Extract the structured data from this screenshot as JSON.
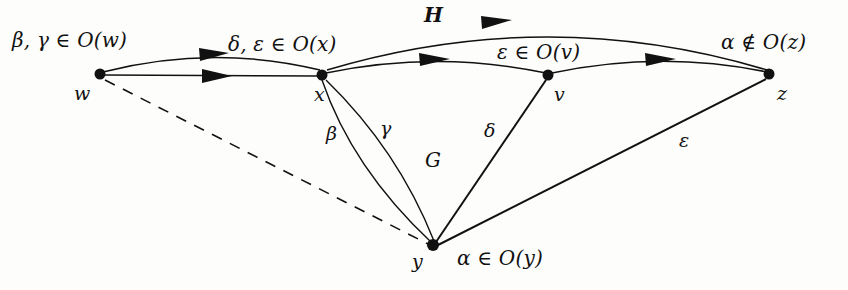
{
  "figure": {
    "title_text": "",
    "background_color": "#fdfdfb",
    "stroke_color": "#111111"
  },
  "nodes": [
    {
      "id": "w",
      "label": "w",
      "x": 100,
      "y": 74,
      "label_x": 74,
      "label_y": 84
    },
    {
      "id": "x",
      "label": "x",
      "x": 322,
      "y": 75,
      "label_x": 314,
      "label_y": 85
    },
    {
      "id": "v",
      "label": "v",
      "x": 548,
      "y": 75,
      "label_x": 554,
      "label_y": 85
    },
    {
      "id": "z",
      "label": "z",
      "x": 769,
      "y": 74,
      "label_x": 777,
      "label_y": 84
    },
    {
      "id": "y",
      "label": "y",
      "x": 433,
      "y": 245,
      "label_x": 412,
      "label_y": 252
    }
  ],
  "set_labels": [
    {
      "id": "o-w",
      "text": "β, γ ∈ O(w)",
      "x": 12,
      "y": 30
    },
    {
      "id": "o-x",
      "text": "δ, ε ∈ O(x)",
      "x": 228,
      "y": 34
    },
    {
      "id": "o-v",
      "text": "ε ∈ O(v)",
      "x": 497,
      "y": 42
    },
    {
      "id": "o-z",
      "text": "α ∉ O(z)",
      "x": 721,
      "y": 32
    },
    {
      "id": "o-y",
      "text": "α ∈ O(y)",
      "x": 457,
      "y": 248
    }
  ],
  "edge_labels": [
    {
      "id": "beta",
      "text": "β",
      "x": 326,
      "y": 124
    },
    {
      "id": "gamma",
      "text": "γ",
      "x": 380,
      "y": 119
    },
    {
      "id": "delta",
      "text": "δ",
      "x": 484,
      "y": 121
    },
    {
      "id": "epsilon",
      "text": "ε",
      "x": 679,
      "y": 131
    }
  ],
  "graph_labels": [
    {
      "id": "G",
      "text": "G",
      "x": 425,
      "y": 150
    },
    {
      "id": "H",
      "text": "H",
      "x": 424,
      "y": 5
    }
  ],
  "edges": [
    {
      "id": "w-x-arc",
      "from": "w",
      "to": "x",
      "style": "curved",
      "directed": true,
      "graph": "H"
    },
    {
      "id": "w-x-straight",
      "from": "w",
      "to": "x",
      "style": "straight",
      "directed": true,
      "graph": "H"
    },
    {
      "id": "x-v-arc",
      "from": "x",
      "to": "v",
      "style": "curved",
      "directed": true,
      "graph": "H"
    },
    {
      "id": "x-z-arc",
      "from": "x",
      "to": "z",
      "style": "curved",
      "directed": true,
      "graph": "H"
    },
    {
      "id": "v-z-arc",
      "from": "v",
      "to": "z",
      "style": "curved",
      "directed": true,
      "graph": "H"
    },
    {
      "id": "w-y-dashed",
      "from": "w",
      "to": "y",
      "style": "dashed",
      "directed": false,
      "graph": "none"
    },
    {
      "id": "x-y-beta",
      "from": "x",
      "to": "y",
      "style": "curved",
      "directed": false,
      "graph": "G"
    },
    {
      "id": "x-y-gamma",
      "from": "x",
      "to": "y",
      "style": "curved",
      "directed": false,
      "graph": "G"
    },
    {
      "id": "y-v-delta",
      "from": "y",
      "to": "v",
      "style": "straight",
      "directed": false,
      "graph": "G"
    },
    {
      "id": "y-z-epsilon",
      "from": "y",
      "to": "z",
      "style": "straight",
      "directed": false,
      "graph": "G"
    }
  ]
}
